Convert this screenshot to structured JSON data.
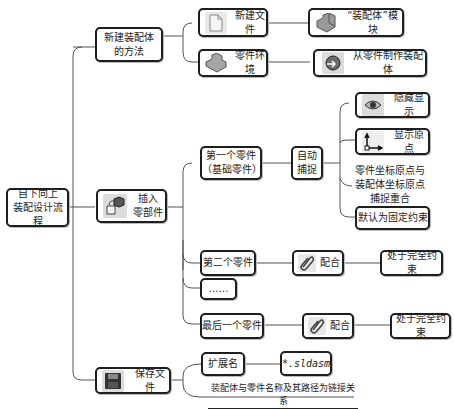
{
  "root": {
    "label": "自下向上\n装配设计流程"
  },
  "branches": {
    "new_method": {
      "label": "新建装配体\n的方法",
      "children": [
        {
          "label": "新建文件",
          "icon": "new-file-icon",
          "result": {
            "label": "“装配体”模块",
            "icon": "assembly-module-icon"
          }
        },
        {
          "label": "零件环境",
          "icon": "part-environment-icon",
          "result": {
            "label": "从零件制作装配体",
            "icon": "make-assembly-from-part-icon"
          }
        }
      ]
    },
    "insert_parts": {
      "label": "插入\n零部件",
      "icon": "insert-components-icon",
      "children": {
        "first": {
          "label": "第一个零件\n（基础零件）",
          "auto_capture": "自动\n捕捉",
          "outcomes": [
            {
              "label": "隐藏显示",
              "icon": "hide-show-eye-icon"
            },
            {
              "label": "显示原点",
              "icon": "show-origin-axes-icon"
            },
            {
              "label": "零件坐标原点与\n装配体坐标原点\n捕捉重合"
            },
            {
              "label": "默认为固定约束"
            }
          ]
        },
        "second": {
          "label": "第二个零件",
          "mate": "配合",
          "mate_icon": "mate-paperclip-icon",
          "result": "处于完全约束"
        },
        "ellipsis": {
          "label": "……"
        },
        "last": {
          "label": "最后一个零件",
          "mate": "配合",
          "mate_icon": "mate-paperclip-icon",
          "result": "处于完全约束"
        }
      }
    },
    "save_file": {
      "label": "保存文件",
      "icon": "save-floppy-icon",
      "extension_label": "扩展名",
      "extension_value": "*.sldasm",
      "note": "装配体与零件名称及其路径为链接关系"
    }
  }
}
